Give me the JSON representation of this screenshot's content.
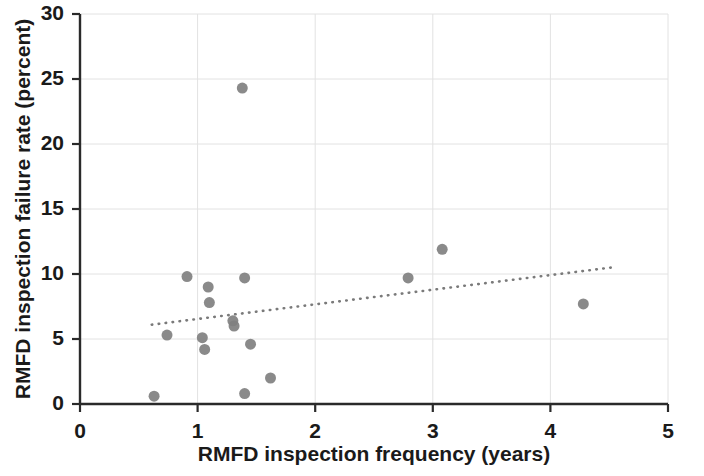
{
  "chart_data": {
    "type": "scatter",
    "title": "",
    "xlabel": "RMFD inspection frequency (years)",
    "ylabel": "RMFD inspection failure rate (percent)",
    "xlim": [
      0,
      5
    ],
    "ylim": [
      0,
      30
    ],
    "xticks": [
      0,
      1,
      2,
      3,
      4,
      5
    ],
    "yticks": [
      0,
      5,
      10,
      15,
      20,
      25,
      30
    ],
    "xtick_labels": [
      "0",
      "1",
      "2",
      "3",
      "4",
      "5"
    ],
    "ytick_labels": [
      "0",
      "5",
      "10",
      "15",
      "20",
      "25",
      "30"
    ],
    "grid": true,
    "grid_color": "#e2e2e2",
    "legend": null,
    "marker_color": "#808080",
    "marker_size": 11,
    "points": [
      {
        "x": 0.63,
        "y": 0.6
      },
      {
        "x": 0.74,
        "y": 5.3
      },
      {
        "x": 0.91,
        "y": 9.8
      },
      {
        "x": 1.04,
        "y": 5.1
      },
      {
        "x": 1.06,
        "y": 4.2
      },
      {
        "x": 1.09,
        "y": 9.0
      },
      {
        "x": 1.1,
        "y": 7.8
      },
      {
        "x": 1.3,
        "y": 6.4
      },
      {
        "x": 1.31,
        "y": 6.0
      },
      {
        "x": 1.38,
        "y": 24.3
      },
      {
        "x": 1.4,
        "y": 9.7
      },
      {
        "x": 1.45,
        "y": 4.6
      },
      {
        "x": 1.4,
        "y": 0.8
      },
      {
        "x": 1.62,
        "y": 2.0
      },
      {
        "x": 2.79,
        "y": 9.7
      },
      {
        "x": 3.08,
        "y": 11.9
      },
      {
        "x": 4.28,
        "y": 7.7
      }
    ],
    "trendline": {
      "style": "dotted",
      "color": "#7a7a7a",
      "x0": 0.61,
      "y0": 6.1,
      "x1": 4.52,
      "y1": 10.5
    }
  }
}
